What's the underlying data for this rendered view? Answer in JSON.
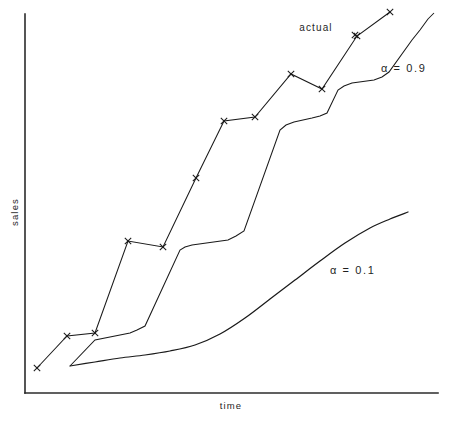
{
  "chart_data": {
    "type": "line",
    "title": "",
    "subtitle": "",
    "xlabel": "time",
    "ylabel": "sales",
    "grid": false,
    "legend_position": "inline-annotations",
    "axis": {
      "x_range_px": [
        25,
        438
      ],
      "y_range_px": [
        14,
        393
      ],
      "ticks": false,
      "tick_labels": [],
      "note": "Schematic chart: axes are unlabeled with no numeric tick marks."
    },
    "annotations": [
      {
        "id": "actual",
        "text": "actual",
        "x_px": 316,
        "y_px": 31
      },
      {
        "id": "alpha-high",
        "text": "α = 0.9",
        "x_px": 381,
        "y_px": 72
      },
      {
        "id": "alpha-low",
        "text": "α = 0.1",
        "x_px": 330,
        "y_px": 274
      }
    ],
    "series": [
      {
        "name": "actual",
        "label": "actual",
        "marker": "x",
        "style": "zigzag-sawtooth",
        "points_px": [
          [
            37,
            368
          ],
          [
            67,
            336
          ],
          [
            95,
            333
          ],
          [
            128,
            241
          ],
          [
            163,
            247
          ],
          [
            196,
            178
          ],
          [
            224,
            121
          ],
          [
            255,
            117
          ],
          [
            291,
            74
          ],
          [
            322,
            89
          ],
          [
            357,
            36
          ],
          [
            390,
            12
          ]
        ]
      },
      {
        "name": "alpha-0.9",
        "label": "α = 0.9",
        "marker": "none",
        "style": "lagging-step",
        "points_px": [
          [
            70,
            366
          ],
          [
            95,
            340
          ],
          [
            130,
            333
          ],
          [
            137,
            330
          ],
          [
            145,
            326
          ],
          [
            180,
            250
          ],
          [
            185,
            247
          ],
          [
            192,
            245
          ],
          [
            228,
            240
          ],
          [
            236,
            236
          ],
          [
            244,
            231
          ],
          [
            280,
            130
          ],
          [
            286,
            125
          ],
          [
            294,
            122
          ],
          [
            312,
            118
          ],
          [
            320,
            116
          ],
          [
            327,
            113
          ],
          [
            338,
            90
          ],
          [
            344,
            86
          ],
          [
            352,
            83
          ],
          [
            374,
            80
          ],
          [
            382,
            77
          ],
          [
            389,
            72
          ],
          [
            412,
            40
          ],
          [
            420,
            30
          ],
          [
            428,
            19
          ],
          [
            434,
            13
          ]
        ]
      },
      {
        "name": "alpha-0.1",
        "label": "α = 0.1",
        "marker": "none",
        "style": "heavily-damped-smooth",
        "points_px": [
          [
            70,
            366
          ],
          [
            95,
            362
          ],
          [
            120,
            358
          ],
          [
            145,
            355
          ],
          [
            170,
            351
          ],
          [
            195,
            345
          ],
          [
            220,
            334
          ],
          [
            245,
            318
          ],
          [
            270,
            299
          ],
          [
            295,
            280
          ],
          [
            320,
            261
          ],
          [
            345,
            243
          ],
          [
            370,
            228
          ],
          [
            390,
            219
          ],
          [
            408,
            212
          ]
        ]
      }
    ]
  },
  "labels": {
    "y_axis": "sales",
    "x_axis": "time"
  },
  "icons": {
    "marker": "x-marker-icon"
  },
  "colors": {
    "axis": "#2b2b2b",
    "series": "#1a1a1a",
    "background": "#ffffff",
    "text": "#1f1f1f"
  }
}
